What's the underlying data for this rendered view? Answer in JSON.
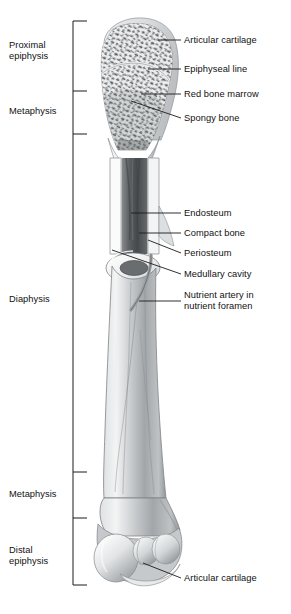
{
  "figure": {
    "palette": {
      "background": "#ffffff",
      "ink": "#111111",
      "leader_line": "#1a1a1a",
      "bracket": "#1a1a1a",
      "bone_light": "#f2f2f2",
      "bone_mid": "#b9bcbe",
      "bone_shadow": "#7e8285",
      "bone_dark": "#5a5e61",
      "cartilage": "#d8dadc",
      "marrow_dark": "#4a4d50",
      "compact_bone": "#fbfbfb",
      "trabecula": "#55585b"
    }
  },
  "region_brackets": {
    "axis_x": 73,
    "tick_length": 14,
    "top_y": 21,
    "bottom_y": 585,
    "ticks": [
      21,
      91,
      134,
      472,
      518,
      585
    ],
    "items": [
      {
        "id": "proximal-epiphysis",
        "label": "Proximal\nepiphysis",
        "label_y": 40,
        "span": [
          21,
          91
        ]
      },
      {
        "id": "metaphysis-proximal",
        "label": "Metaphysis",
        "label_y": 106,
        "span": [
          91,
          134
        ]
      },
      {
        "id": "diaphysis",
        "label": "Diaphysis",
        "label_y": 294,
        "span": [
          134,
          472
        ]
      },
      {
        "id": "metaphysis-distal",
        "label": "Metaphysis",
        "label_y": 489,
        "span": [
          472,
          518
        ]
      },
      {
        "id": "distal-epiphysis",
        "label": "Distal\nepiphysis",
        "label_y": 545,
        "span": [
          518,
          585
        ]
      }
    ]
  },
  "callouts": [
    {
      "id": "articular-cartilage-proximal",
      "label": "Articular cartilage",
      "text_x": 184,
      "text_y": 35,
      "leader": {
        "x1": 158,
        "y1": 40,
        "x2": 181,
        "y2": 40
      },
      "pointer": {
        "x": 158,
        "y": 40
      }
    },
    {
      "id": "epiphyseal-line",
      "label": "Epiphyseal line",
      "text_x": 184,
      "text_y": 64,
      "leader": {
        "x1": 148,
        "y1": 69,
        "x2": 181,
        "y2": 69
      },
      "pointer": {
        "x": 148,
        "y": 69
      }
    },
    {
      "id": "red-bone-marrow",
      "label": "Red bone marrow",
      "text_x": 184,
      "text_y": 89,
      "leader": {
        "x1": 141,
        "y1": 94,
        "x2": 181,
        "y2": 94
      },
      "pointer": {
        "x": 141,
        "y": 94
      }
    },
    {
      "id": "spongy-bone",
      "label": "Spongy bone",
      "text_x": 184,
      "text_y": 113,
      "leader": {
        "x1": 131,
        "y1": 101,
        "x2": 181,
        "y2": 118
      },
      "pointer": {
        "x": 131,
        "y": 101
      }
    },
    {
      "id": "endosteum",
      "label": "Endosteum",
      "text_x": 184,
      "text_y": 208,
      "leader": {
        "x1": 131,
        "y1": 213,
        "x2": 181,
        "y2": 213
      },
      "pointer": {
        "x": 131,
        "y": 213
      }
    },
    {
      "id": "compact-bone",
      "label": "Compact bone",
      "text_x": 184,
      "text_y": 228,
      "leader": {
        "x1": 139,
        "y1": 233,
        "x2": 181,
        "y2": 233
      },
      "pointer": {
        "x": 139,
        "y": 233
      }
    },
    {
      "id": "periosteum",
      "label": "Periosteum",
      "text_x": 184,
      "text_y": 248,
      "leader": {
        "x1": 148,
        "y1": 240,
        "x2": 181,
        "y2": 253
      },
      "pointer": {
        "x": 148,
        "y": 240
      }
    },
    {
      "id": "medullary-cavity",
      "label": "Medullary cavity",
      "text_x": 184,
      "text_y": 269,
      "leader": {
        "x1": 112,
        "y1": 250,
        "x2": 181,
        "y2": 274
      },
      "pointer": {
        "x": 112,
        "y": 250
      }
    },
    {
      "id": "nutrient-artery",
      "label": "Nutrient artery in\nnutrient foramen",
      "text_x": 184,
      "text_y": 290,
      "leader": {
        "x1": 139,
        "y1": 301,
        "x2": 181,
        "y2": 301
      },
      "pointer": {
        "x": 139,
        "y": 301
      }
    },
    {
      "id": "articular-cartilage-distal",
      "label": "Articular cartilage",
      "text_x": 184,
      "text_y": 573,
      "leader": {
        "x1": 143,
        "y1": 563,
        "x2": 181,
        "y2": 578
      },
      "pointer": {
        "x": 143,
        "y": 563
      }
    }
  ]
}
